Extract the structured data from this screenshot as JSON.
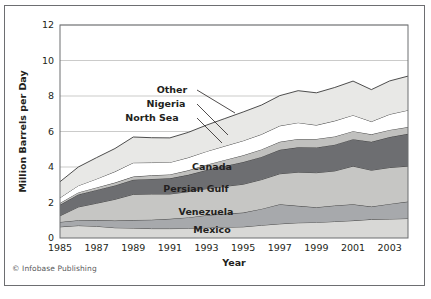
{
  "figure": {
    "credit": "© Infobase Publishing"
  },
  "chart_data": {
    "type": "area",
    "stacked": true,
    "title": "",
    "subtitle": "",
    "xlabel": "Year",
    "ylabel": "Million Barrels per Day",
    "xlim": [
      1985,
      2004
    ],
    "ylim": [
      0,
      12
    ],
    "yticks": [
      0,
      2,
      4,
      6,
      8,
      10,
      12
    ],
    "ytick_labels": [
      "0",
      "2",
      "4",
      "6",
      "8",
      "10",
      "12"
    ],
    "xticks": [
      1985,
      1987,
      1989,
      1991,
      1993,
      1995,
      1997,
      1999,
      2001,
      2003
    ],
    "xtick_labels": [
      "1985",
      "1987",
      "1989",
      "1991",
      "1993",
      "1995",
      "1997",
      "1999",
      "2001",
      "2003"
    ],
    "grid": "horizontal",
    "legend_position": "inline-annotations",
    "x": [
      1985,
      1986,
      1987,
      1988,
      1989,
      1990,
      1991,
      1992,
      1993,
      1994,
      1995,
      1996,
      1997,
      1998,
      1999,
      2000,
      2001,
      2002,
      2003,
      2004
    ],
    "series": [
      {
        "name": "Mexico",
        "color": "#d8d8d6",
        "values": [
          0.63,
          0.7,
          0.66,
          0.58,
          0.56,
          0.53,
          0.53,
          0.54,
          0.58,
          0.61,
          0.63,
          0.72,
          0.8,
          0.86,
          0.88,
          0.93,
          0.98,
          1.05,
          1.07,
          1.1
        ]
      },
      {
        "name": "Venezuela",
        "color": "#a7a9ac",
        "values": [
          0.27,
          0.3,
          0.35,
          0.4,
          0.45,
          0.5,
          0.55,
          0.62,
          0.7,
          0.75,
          0.8,
          0.92,
          1.1,
          0.95,
          0.85,
          0.9,
          0.92,
          0.72,
          0.85,
          0.95
        ]
      },
      {
        "name": "Persian Gulf",
        "color": "#c6c6c4",
        "values": [
          0.35,
          0.75,
          0.95,
          1.2,
          1.45,
          1.45,
          1.4,
          1.45,
          1.5,
          1.55,
          1.6,
          1.65,
          1.72,
          1.9,
          1.95,
          1.95,
          2.15,
          2.05,
          2.05,
          2.0
        ]
      },
      {
        "name": "Canada",
        "color": "#6d6e71",
        "values": [
          0.62,
          0.7,
          0.75,
          0.78,
          0.82,
          0.85,
          0.88,
          0.95,
          1.05,
          1.15,
          1.25,
          1.28,
          1.35,
          1.4,
          1.42,
          1.48,
          1.52,
          1.6,
          1.72,
          1.82
        ]
      },
      {
        "name": "North Sea",
        "color": "#c0c0be",
        "values": [
          0.1,
          0.12,
          0.14,
          0.16,
          0.18,
          0.2,
          0.22,
          0.25,
          0.3,
          0.34,
          0.38,
          0.42,
          0.45,
          0.47,
          0.48,
          0.46,
          0.45,
          0.42,
          0.4,
          0.38
        ]
      },
      {
        "name": "Nigeria",
        "color": "#ffffff",
        "values": [
          0.3,
          0.38,
          0.48,
          0.62,
          0.78,
          0.72,
          0.68,
          0.72,
          0.75,
          0.78,
          0.82,
          0.85,
          0.9,
          0.92,
          0.78,
          0.88,
          0.9,
          0.72,
          0.88,
          0.95
        ]
      },
      {
        "name": "Other",
        "color": "#e8e8e6",
        "values": [
          0.9,
          1.05,
          1.2,
          1.3,
          1.45,
          1.4,
          1.38,
          1.42,
          1.48,
          1.55,
          1.62,
          1.65,
          1.7,
          1.8,
          1.82,
          1.88,
          1.92,
          1.8,
          1.88,
          1.92
        ]
      }
    ],
    "annotations": [
      {
        "text": "Other",
        "x": 172,
        "y": 93
      },
      {
        "text": "Nigeria",
        "x": 166,
        "y": 107
      },
      {
        "text": "North Sea",
        "x": 152,
        "y": 121
      },
      {
        "text": "Canada",
        "x": 212,
        "y": 170
      },
      {
        "text": "Persian Gulf",
        "x": 196,
        "y": 192
      },
      {
        "text": "Venezuela",
        "x": 206,
        "y": 215
      },
      {
        "text": "Mexico",
        "x": 212,
        "y": 233
      }
    ]
  }
}
